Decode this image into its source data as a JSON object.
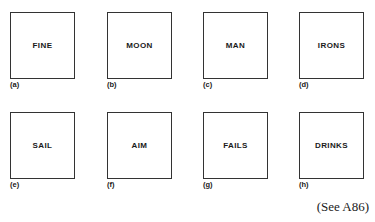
{
  "figure": {
    "panels": [
      {
        "word": "FINE",
        "label": "(a)"
      },
      {
        "word": "MOON",
        "label": "(b)"
      },
      {
        "word": "MAN",
        "label": "(c)"
      },
      {
        "word": "IRONS",
        "label": "(d)"
      },
      {
        "word": "SAIL",
        "label": "(e)"
      },
      {
        "word": "AIM",
        "label": "(f)"
      },
      {
        "word": "FAILS",
        "label": "(g)"
      },
      {
        "word": "DRINKS",
        "label": "(h)"
      }
    ],
    "reference": "(See A86)"
  }
}
